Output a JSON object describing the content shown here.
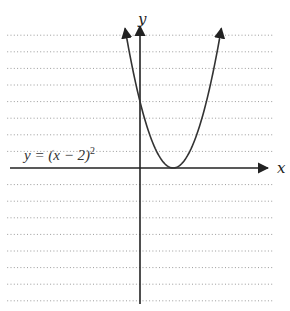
{
  "chart_data": {
    "type": "line",
    "title": "",
    "function": "y = (x - 2)^2",
    "series": [
      {
        "name": "y = (x - 2)^2",
        "x": [
          -0.9,
          -0.5,
          0,
          0.5,
          1,
          1.5,
          2,
          2.5,
          3,
          3.5,
          4,
          4.5,
          4.9
        ],
        "values": [
          8.41,
          6.25,
          4,
          2.25,
          1,
          0.25,
          0,
          0.25,
          1,
          2.25,
          4,
          6.25,
          8.41
        ]
      }
    ],
    "vertex": [
      2,
      0
    ],
    "y_intercept": 4,
    "xlabel": "x",
    "ylabel": "y",
    "xlim": [
      -8,
      8
    ],
    "ylim": [
      -8,
      8
    ],
    "grid": true,
    "grid_style": "dotted",
    "annotations": [
      {
        "text": "y = (x − 2)²",
        "position": "left, above x-axis"
      }
    ]
  },
  "labels": {
    "x_axis": "x",
    "y_axis": "y",
    "equation_prefix": "y = (x − 2)",
    "equation_exponent": "2"
  },
  "colors": {
    "axis": "#222222",
    "curve": "#333333",
    "grid": "#9a9a9a",
    "background": "#ffffff"
  }
}
